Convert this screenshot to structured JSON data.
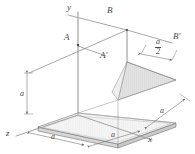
{
  "figure": {
    "background_color": "#ffffff",
    "line_color": "#6b6b6b",
    "label_color": "#4a4a4a",
    "plate_top_fill": "#f2f2f2",
    "plate_edge_fill": "#d8d8d8",
    "fin_fill": "#dedede"
  },
  "axes": [
    {
      "key": "y",
      "label": "y",
      "name": "y-axis-label"
    },
    {
      "key": "x",
      "label": "x",
      "name": "x-axis-label"
    },
    {
      "key": "z",
      "label": "z",
      "name": "z-axis-label"
    }
  ],
  "points": [
    {
      "key": "A",
      "label": "A",
      "name": "point-label-a"
    },
    {
      "key": "Aprime",
      "label": "A′",
      "name": "point-label-a-prime"
    },
    {
      "key": "B",
      "label": "B",
      "name": "point-label-b"
    },
    {
      "key": "Bprime",
      "label": "B′",
      "name": "point-label-b-prime"
    }
  ],
  "dimensions": [
    {
      "key": "height",
      "label": "a",
      "name": "dimension-height-a"
    },
    {
      "key": "depth_left",
      "label": "a",
      "name": "dimension-depth-a"
    },
    {
      "key": "width_front",
      "label": "a",
      "name": "dimension-width-a"
    },
    {
      "key": "width_right",
      "label": "a",
      "name": "dimension-right-a"
    },
    {
      "key": "half_width",
      "label": "a/2",
      "numerator": "a",
      "denominator": "2",
      "name": "dimension-half-a"
    }
  ]
}
